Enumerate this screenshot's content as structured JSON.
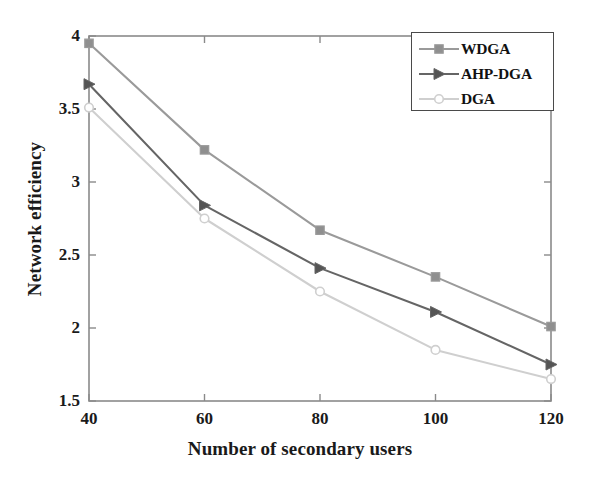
{
  "chart_data": {
    "type": "line",
    "title": "",
    "xlabel": "Number of secondary users",
    "ylabel": "Network efficiency",
    "x": [
      40,
      60,
      80,
      100,
      120
    ],
    "xticklabels": [
      "40",
      "60",
      "80",
      "100",
      "120"
    ],
    "yticklabels": [
      "1.5",
      "2",
      "2.5",
      "3",
      "3.5",
      "4"
    ],
    "yticks": [
      1.5,
      2,
      2.5,
      3,
      3.5,
      4
    ],
    "xlim": [
      40,
      120
    ],
    "ylim": [
      1.5,
      4
    ],
    "grid": false,
    "legend_position": "top-right",
    "series": [
      {
        "name": "WDGA",
        "values": [
          3.95,
          3.22,
          2.67,
          2.35,
          2.01
        ],
        "color": "#9a9a9a",
        "marker": "square",
        "marker_fill": "#8f8f8f"
      },
      {
        "name": "AHP-DGA",
        "values": [
          3.67,
          2.84,
          2.41,
          2.11,
          1.75
        ],
        "color": "#656565",
        "marker": "right-triangle",
        "marker_fill": "#555555"
      },
      {
        "name": "DGA",
        "values": [
          3.51,
          2.75,
          2.25,
          1.85,
          1.65
        ],
        "color": "#cfcfcf",
        "marker": "circle",
        "marker_fill": "#ffffff"
      }
    ]
  },
  "axes": {
    "frame_color": "#8a8a8a",
    "tick_color": "#8a8a8a"
  }
}
